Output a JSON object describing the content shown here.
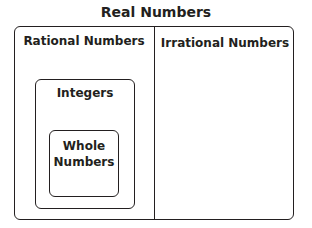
{
  "diagram": {
    "title": "Real Numbers",
    "regions": {
      "rational": "Rational Numbers",
      "irrational": "Irrational Numbers",
      "integers": "Integers",
      "whole_line1": "Whole",
      "whole_line2": "Numbers"
    }
  }
}
